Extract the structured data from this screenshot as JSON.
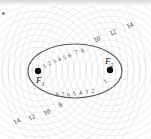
{
  "figure": {
    "width": 151,
    "height": 139,
    "background_color": "#ffffff",
    "ellipse_stroke_color": "#5a5a5a",
    "circle_stroke_color": "#d9d9d9",
    "label_color": "#3b3b3b"
  },
  "foci": [
    {
      "name": "F1",
      "label": "F",
      "subscript": "1",
      "x": 38,
      "y": 71
    },
    {
      "name": "F2",
      "label": "F",
      "subscript": "2",
      "x": 110,
      "y": 70
    }
  ],
  "ellipse": {
    "cx": 75,
    "cy": 71,
    "rx": 47,
    "ry": 27
  },
  "labels_inside_top": [
    "1",
    "2",
    "3",
    "4",
    "5",
    "6",
    "7",
    "8"
  ],
  "labels_inside_bottom": [
    "8",
    "7",
    "6",
    "5",
    "4",
    "3",
    "2",
    "1"
  ],
  "labels_outside_top_right": [
    "10",
    "12",
    "14"
  ],
  "labels_outside_bottom_left": [
    "14",
    "12",
    "10",
    "8"
  ],
  "corner_mark": "dot"
}
